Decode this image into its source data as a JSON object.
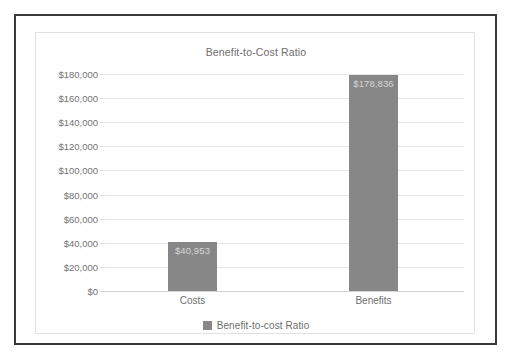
{
  "frame": {
    "border_color": "#3a3a3e",
    "panel_border_color": "#e2e2e2"
  },
  "chart_data": {
    "type": "bar",
    "title": "Benefit-to-Cost Ratio",
    "xlabel": "",
    "ylabel": "",
    "categories": [
      "Costs",
      "Benefits"
    ],
    "values": [
      40953,
      178836
    ],
    "value_labels": [
      "$40,953",
      "$178,836"
    ],
    "series": [
      {
        "name": "Benefit-to-cost Ratio",
        "values": [
          40953,
          178836
        ],
        "color": "#878787"
      }
    ],
    "ylim": [
      0,
      180000
    ],
    "ytick_values": [
      0,
      20000,
      40000,
      60000,
      80000,
      100000,
      120000,
      140000,
      160000,
      180000
    ],
    "ytick_labels": [
      "$0",
      "$20,000",
      "$40,000",
      "$60,000",
      "$80,000",
      "$100,000",
      "$120,000",
      "$140,000",
      "$160,000",
      "$180,000"
    ],
    "grid": true,
    "grid_color": "#e6e6e6",
    "legend": {
      "position": "bottom",
      "entries": [
        {
          "label": "Benefit-to-cost Ratio",
          "color": "#878787"
        }
      ]
    },
    "bar_color": "#878787",
    "value_label_color": "#d6d6d6",
    "axis_text_color": "#6e6e6e"
  }
}
